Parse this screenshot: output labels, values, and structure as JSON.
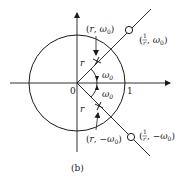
{
  "figure": {
    "caption": "(b)",
    "origin_label": "0",
    "unit_label": "1",
    "radius_label": "r",
    "angle_label": "ω₀",
    "points": {
      "upper_pole": {
        "open": "(",
        "r": "r",
        "sep": ", ",
        "w": "ω",
        "sub": "0",
        "close": ")"
      },
      "lower_pole": {
        "open": "(",
        "r": "r",
        "sep": ", −",
        "w": "ω",
        "sub": "0",
        "close": ")"
      },
      "upper_zero": {
        "num": "1",
        "den": "r",
        "sep": ", ",
        "w": "ω",
        "sub": "0"
      },
      "lower_zero": {
        "num": "1",
        "den": "r",
        "sep": ", −",
        "w": "ω",
        "sub": "0"
      }
    },
    "colors": {
      "ink": "#1a1a1a",
      "background": "#ffffff"
    }
  }
}
